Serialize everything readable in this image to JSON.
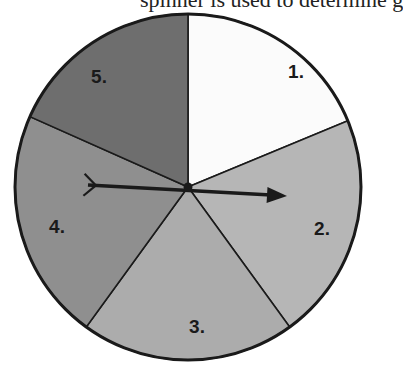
{
  "diagram": {
    "type": "spinner",
    "top_text_cropped": "spinner is used to determine g",
    "center": [
      188,
      187
    ],
    "radius": 173,
    "sectors": [
      {
        "label": "1.",
        "start_deg": 0,
        "end_deg": 67.5,
        "color": "#fbfbfb",
        "label_pos": [
          296,
          78
        ]
      },
      {
        "label": "2.",
        "start_deg": 67.5,
        "end_deg": 144,
        "color": "#b6b6b6",
        "label_pos": [
          322,
          235
        ]
      },
      {
        "label": "3.",
        "start_deg": 144,
        "end_deg": 216,
        "color": "#acacac",
        "label_pos": [
          197,
          333
        ]
      },
      {
        "label": "4.",
        "start_deg": 216,
        "end_deg": 294,
        "color": "#8f8f8f",
        "label_pos": [
          57,
          233
        ]
      },
      {
        "label": "5.",
        "start_deg": 294,
        "end_deg": 360,
        "color": "#6e6e6e",
        "label_pos": [
          99,
          83
        ]
      }
    ],
    "spinner_arrow": {
      "tail": [
        88,
        185
      ],
      "tip": [
        287,
        196
      ],
      "color": "#1a1a1a"
    }
  }
}
